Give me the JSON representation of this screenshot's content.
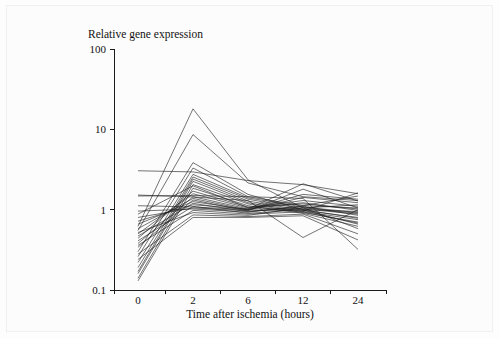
{
  "figure": {
    "title": "Relative gene expression",
    "background_color": "#fcfcfc",
    "border_color": "#f0f0f0",
    "line_color": "#1c1c1c"
  },
  "chart_data": {
    "type": "line",
    "title": "Relative gene expression",
    "xlabel": "Time after ischemia (hours)",
    "ylabel": "Relative gene expression",
    "yscale": "log",
    "ylim": [
      0.1,
      100
    ],
    "ytick_labels": [
      "100",
      "10",
      "1",
      "0.1"
    ],
    "ytick_values": [
      100,
      10,
      1,
      0.1
    ],
    "xtick_labels": [
      "0",
      "2",
      "6",
      "12",
      "24"
    ],
    "x": [
      0,
      2,
      6,
      12,
      24
    ],
    "x_spacing": "categorical",
    "grid": false,
    "legend": false,
    "series": [
      {
        "name": "gene-01",
        "values": [
          0.62,
          18.0,
          2.35,
          1.05,
          1.15
        ]
      },
      {
        "name": "gene-02",
        "values": [
          0.55,
          8.6,
          2.15,
          1.45,
          1.3
        ]
      },
      {
        "name": "gene-03",
        "values": [
          0.3,
          3.85,
          1.55,
          1.0,
          0.95
        ]
      },
      {
        "name": "gene-04",
        "values": [
          0.26,
          3.3,
          1.45,
          1.12,
          1.05
        ]
      },
      {
        "name": "gene-05",
        "values": [
          0.22,
          2.75,
          1.4,
          1.08,
          0.92
        ]
      },
      {
        "name": "gene-06",
        "values": [
          0.19,
          2.55,
          1.35,
          1.02,
          0.88
        ]
      },
      {
        "name": "gene-07",
        "values": [
          0.17,
          2.4,
          1.28,
          0.98,
          0.8
        ]
      },
      {
        "name": "gene-08",
        "values": [
          0.16,
          2.25,
          1.22,
          0.95,
          0.75
        ]
      },
      {
        "name": "gene-09",
        "values": [
          0.14,
          2.05,
          1.18,
          0.92,
          0.7
        ]
      },
      {
        "name": "gene-10",
        "values": [
          0.13,
          1.85,
          1.12,
          0.9,
          0.62
        ]
      },
      {
        "name": "gene-11",
        "values": [
          0.44,
          1.7,
          1.08,
          1.18,
          1.02
        ]
      },
      {
        "name": "gene-12",
        "values": [
          0.5,
          1.58,
          1.05,
          1.3,
          1.1
        ]
      },
      {
        "name": "gene-13",
        "values": [
          0.38,
          1.45,
          1.02,
          1.22,
          0.98
        ]
      },
      {
        "name": "gene-14",
        "values": [
          0.58,
          1.38,
          0.99,
          1.42,
          1.22
        ]
      },
      {
        "name": "gene-15",
        "values": [
          0.34,
          1.32,
          0.96,
          1.05,
          0.9
        ]
      },
      {
        "name": "gene-16",
        "values": [
          0.66,
          1.26,
          1.0,
          1.55,
          1.35
        ]
      },
      {
        "name": "gene-17",
        "values": [
          0.47,
          1.2,
          0.94,
          1.1,
          0.85
        ]
      },
      {
        "name": "gene-18",
        "values": [
          0.72,
          1.15,
          1.02,
          2.1,
          1.28
        ]
      },
      {
        "name": "gene-19",
        "values": [
          0.41,
          1.1,
          0.9,
          1.0,
          0.78
        ]
      },
      {
        "name": "gene-20",
        "values": [
          0.8,
          1.05,
          0.97,
          1.8,
          1.05
        ]
      },
      {
        "name": "gene-21",
        "values": [
          0.36,
          0.98,
          0.88,
          0.94,
          0.68
        ]
      },
      {
        "name": "gene-22",
        "values": [
          0.52,
          0.92,
          0.85,
          1.06,
          0.58
        ]
      },
      {
        "name": "gene-23",
        "values": [
          0.28,
          0.86,
          0.82,
          0.88,
          0.5
        ]
      },
      {
        "name": "gene-24",
        "values": [
          0.24,
          0.8,
          0.8,
          0.84,
          0.42
        ]
      },
      {
        "name": "gene-25",
        "values": [
          1.48,
          1.5,
          1.45,
          1.38,
          0.32
        ]
      },
      {
        "name": "gene-26",
        "values": [
          3.05,
          2.95,
          2.3,
          2.05,
          1.58
        ]
      },
      {
        "name": "gene-27",
        "values": [
          1.52,
          1.44,
          1.3,
          0.45,
          1.0
        ]
      },
      {
        "name": "gene-28",
        "values": [
          1.12,
          1.08,
          1.0,
          0.96,
          1.62
        ]
      },
      {
        "name": "gene-29",
        "values": [
          0.96,
          1.02,
          0.93,
          1.12,
          1.48
        ]
      },
      {
        "name": "gene-30",
        "values": [
          0.88,
          1.98,
          1.06,
          0.99,
          0.66
        ]
      }
    ]
  },
  "axes": {
    "x_title": "Time after ischemia (hours)",
    "y_ticks": [
      {
        "label": "100",
        "value": 100
      },
      {
        "label": "10",
        "value": 10
      },
      {
        "label": "1",
        "value": 1
      },
      {
        "label": "0.1",
        "value": 0.1
      }
    ],
    "x_ticks": [
      {
        "label": "0",
        "value": 0
      },
      {
        "label": "2",
        "value": 2
      },
      {
        "label": "6",
        "value": 6
      },
      {
        "label": "12",
        "value": 12
      },
      {
        "label": "24",
        "value": 24
      }
    ]
  }
}
